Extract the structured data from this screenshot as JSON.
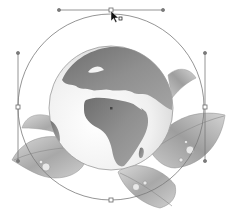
{
  "canvas": {
    "width": 235,
    "height": 216,
    "background": "#ffffff"
  },
  "artwork": {
    "subject": "globe-with-leaves",
    "globe": {
      "cx": 111,
      "cy": 108,
      "r": 62,
      "ocean_color": "#f2f2f2",
      "land_color": "#8c8c8c"
    },
    "leaves_color": "#b5b5b5"
  },
  "selection": {
    "path_shape": "circle",
    "cx": 111,
    "cy": 107,
    "r": 93,
    "stroke_color": "#7a7a7a",
    "center_point": {
      "x": 111,
      "y": 108
    },
    "anchors": [
      {
        "name": "top",
        "x": 111,
        "y": 10,
        "handle_a": {
          "x": 59,
          "y": 10
        },
        "handle_b": {
          "x": 163,
          "y": 10
        }
      },
      {
        "name": "left",
        "x": 18,
        "y": 107,
        "handle_a": {
          "x": 18,
          "y": 53
        },
        "handle_b": {
          "x": 18,
          "y": 161
        }
      },
      {
        "name": "right",
        "x": 205,
        "y": 107,
        "handle_a": {
          "x": 205,
          "y": 53
        },
        "handle_b": {
          "x": 205,
          "y": 161
        }
      },
      {
        "name": "bottom",
        "x": 111,
        "y": 200
      }
    ]
  },
  "cursor": {
    "type": "direct-selection-arrow",
    "x": 111,
    "y": 11
  }
}
